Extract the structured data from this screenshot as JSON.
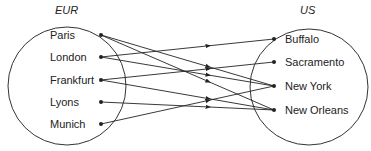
{
  "diagram": {
    "type": "mapping",
    "domain_set": {
      "title": "EUR",
      "elements": [
        "Paris",
        "London",
        "Frankfurt",
        "Lyons",
        "Munich"
      ]
    },
    "codomain_set": {
      "title": "US",
      "elements": [
        "Buffalo",
        "Sacramento",
        "New York",
        "New Orleans"
      ]
    },
    "edges": [
      {
        "from": "Paris",
        "to": "New York"
      },
      {
        "from": "Paris",
        "to": "New Orleans"
      },
      {
        "from": "London",
        "to": "Buffalo"
      },
      {
        "from": "London",
        "to": "New York"
      },
      {
        "from": "Frankfurt",
        "to": "Sacramento"
      },
      {
        "from": "Frankfurt",
        "to": "New Orleans"
      },
      {
        "from": "Lyons",
        "to": "New Orleans"
      },
      {
        "from": "Munich",
        "to": "New York"
      }
    ],
    "colors": {
      "line": "#222222",
      "background": "#ffffff"
    }
  }
}
